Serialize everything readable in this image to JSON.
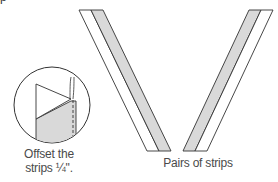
{
  "diagram": {
    "top_fragment": "p",
    "inset": {
      "caption_line1": "Offset the",
      "caption_line2": "strips ¼\"."
    },
    "strips": {
      "caption": "Pairs of strips",
      "fill_color": "#d9d9d9",
      "stroke_color": "#333333"
    }
  }
}
